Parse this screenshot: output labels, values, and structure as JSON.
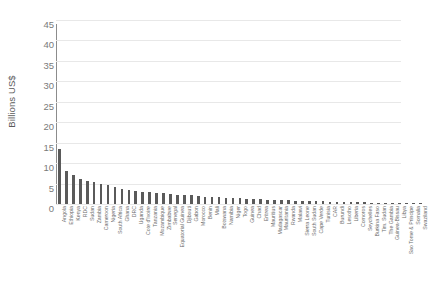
{
  "chart_data": {
    "type": "bar",
    "title": "",
    "subtitle": "",
    "xlabel": "",
    "ylabel": "Billions US$",
    "ylim": [
      0,
      45
    ],
    "ytick_step": 5,
    "ytick_labels": [
      "45",
      "40",
      "35",
      "30",
      "25",
      "20",
      "15",
      "10",
      "5",
      "0"
    ],
    "grid": true,
    "legend": false,
    "bar_color": "#5a5a5a",
    "grid_color": "#e8e8e8",
    "axis_color": "#8c8c8c",
    "categories": [
      "Angola",
      "Ethiopia",
      "Kenya",
      "RDC",
      "Sudan",
      "Zambia",
      "Cameroon",
      "Nigeria",
      "South Africa",
      "Ghana",
      "DRC",
      "Uganda",
      "Cote d'Ivoire",
      "Tanzania",
      "Mozambique",
      "Zimbabwe",
      "Senegal",
      "Equatorial Guinea",
      "Djibouti",
      "Gabon",
      "Morocco",
      "Benin",
      "Mali",
      "Botswana",
      "Namibia",
      "Niger",
      "Togo",
      "Guinea",
      "Chad",
      "Eritrea",
      "Mauritius",
      "Madagascar",
      "Mauritania",
      "Rwanda",
      "Malawi",
      "Sierra Leone",
      "South Sudan",
      "Cape Verde",
      "Tunisia",
      "CAR",
      "Burundi",
      "Lesotho",
      "Liberia",
      "Comoros",
      "Seychelles",
      "Burkina Faso",
      "Tim. Sudan",
      "The Gambia",
      "Guinea-Bissau",
      "Libya",
      "Sao Tome & Principe",
      "Somalia",
      "Swaziland"
    ],
    "values": [
      13.4,
      8.1,
      7.0,
      6.1,
      5.6,
      5.5,
      5.0,
      4.6,
      4.2,
      3.6,
      3.4,
      3.2,
      3.0,
      2.9,
      2.8,
      2.6,
      2.5,
      2.3,
      2.2,
      2.1,
      1.9,
      1.8,
      1.7,
      1.6,
      1.5,
      1.4,
      1.35,
      1.3,
      1.2,
      1.15,
      1.1,
      1.0,
      0.95,
      0.9,
      0.85,
      0.8,
      0.75,
      0.7,
      0.65,
      0.6,
      0.55,
      0.5,
      0.45,
      0.42,
      0.4,
      0.36,
      0.33,
      0.3,
      0.27,
      0.24,
      0.2,
      0.16,
      0.12
    ]
  }
}
